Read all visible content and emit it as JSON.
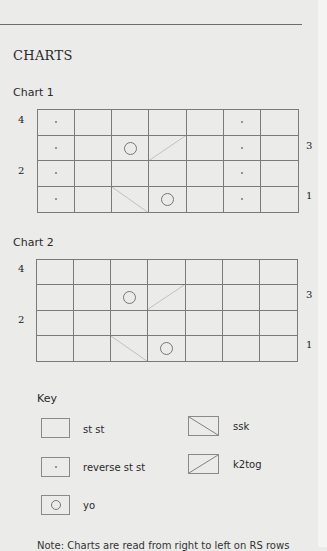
{
  "section": {
    "title": "CHARTS"
  },
  "charts": [
    {
      "label": "Chart 1",
      "row_labels_left": [
        "4",
        "2"
      ],
      "row_labels_right": [
        "3",
        "1"
      ],
      "columns": 7,
      "rows": 4,
      "cells_top_to_bottom": [
        [
          "reverse st st",
          "st st",
          "st st",
          "st st",
          "st st",
          "reverse st st",
          "st st"
        ],
        [
          "reverse st st",
          "st st",
          "yo",
          "k2tog",
          "st st",
          "reverse st st",
          "st st"
        ],
        [
          "reverse st st",
          "st st",
          "st st",
          "st st",
          "st st",
          "reverse st st",
          "st st"
        ],
        [
          "reverse st st",
          "st st",
          "ssk",
          "yo",
          "st st",
          "reverse st st",
          "st st"
        ]
      ]
    },
    {
      "label": "Chart 2",
      "row_labels_left": [
        "4",
        "2"
      ],
      "row_labels_right": [
        "3",
        "1"
      ],
      "columns": 7,
      "rows": 4,
      "cells_top_to_bottom": [
        [
          "st st",
          "st st",
          "st st",
          "st st",
          "st st",
          "st st",
          "st st"
        ],
        [
          "st st",
          "st st",
          "yo",
          "k2tog",
          "st st",
          "st st",
          "st st"
        ],
        [
          "st st",
          "st st",
          "st st",
          "st st",
          "st st",
          "st st",
          "st st"
        ],
        [
          "st st",
          "st st",
          "ssk",
          "yo",
          "st st",
          "st st",
          "st st"
        ]
      ]
    }
  ],
  "key": {
    "title": "Key",
    "items": [
      {
        "symbol": "empty-box",
        "label": "st st"
      },
      {
        "symbol": "dot",
        "label": "reverse st st"
      },
      {
        "symbol": "circle",
        "label": "yo"
      },
      {
        "symbol": "diagonal-down",
        "label": "ssk"
      },
      {
        "symbol": "diagonal-up",
        "label": "k2tog"
      }
    ]
  },
  "note": "Note: Charts are read from right to left on RS rows"
}
